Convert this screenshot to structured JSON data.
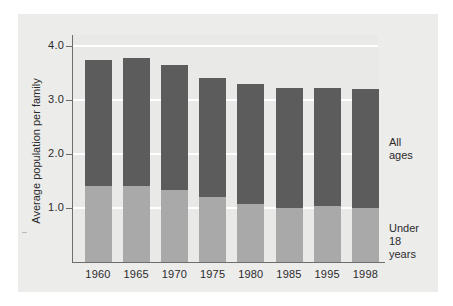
{
  "chart_data": {
    "type": "bar",
    "title": "",
    "subtitle": "",
    "xlabel": "",
    "ylabel": "Average population per family",
    "categories": [
      "1960",
      "1965",
      "1970",
      "1975",
      "1980",
      "1985",
      "1995",
      "1998"
    ],
    "stacked": true,
    "series": [
      {
        "name": "Under 18 years",
        "color": "#a9a9a9",
        "values": [
          1.41,
          1.41,
          1.33,
          1.2,
          1.07,
          1.0,
          1.03,
          1.0
        ]
      },
      {
        "name": "All ages",
        "color": "#5c5c5c",
        "note": "upper segment; series total shown is the full bar height",
        "values": [
          2.34,
          2.36,
          2.32,
          2.21,
          2.23,
          2.22,
          2.19,
          2.2
        ]
      }
    ],
    "totals": [
      3.75,
      3.77,
      3.65,
      3.41,
      3.3,
      3.22,
      3.22,
      3.2
    ],
    "ylim": [
      0,
      4.3
    ],
    "yticks": [
      "1.0",
      "2.0",
      "3.0",
      "4.0"
    ],
    "ytick_values": [
      1.0,
      2.0,
      3.0,
      4.0
    ],
    "grid": true,
    "gridline_color": "#ffffff",
    "legend_position": "right-inside",
    "annotations": [
      {
        "name": "all-ages",
        "lines": [
          "All",
          "ages"
        ]
      },
      {
        "name": "under-18-years",
        "lines": [
          "Under",
          "18",
          "years"
        ]
      }
    ],
    "colors": {
      "upper_segment": "#5c5c5c",
      "lower_segment": "#a9a9a9",
      "plot_background": "#e9e9e7",
      "panel_background": "#ececeb",
      "axis": "#6d6d6d",
      "text": "#2b2b2b"
    }
  },
  "legend": {
    "all_ages_line1": "All",
    "all_ages_line2": "ages",
    "under18_line1": "Under",
    "under18_line2": "18",
    "under18_line3": "years"
  },
  "axis": {
    "y_title": "Average population per family",
    "y_tick_1": "1.0",
    "y_tick_2": "2.0",
    "y_tick_3": "3.0",
    "y_tick_4": "4.0"
  }
}
